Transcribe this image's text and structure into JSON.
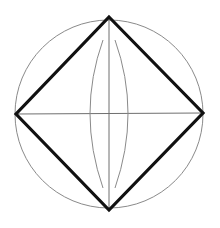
{
  "diagram": {
    "type": "geometric-construction",
    "canvas": {
      "width": 220,
      "height": 228,
      "background": "#ffffff"
    },
    "colors": {
      "thin": "#8a8a8a",
      "thick": "#111111",
      "axis": "#6f6f6f"
    },
    "circle": {
      "cx": 109,
      "cy": 114,
      "r": 94
    },
    "square_vertices": [
      {
        "name": "top",
        "x": 109,
        "y": 17
      },
      {
        "name": "right",
        "x": 203,
        "y": 113
      },
      {
        "name": "bottom",
        "x": 109,
        "y": 210
      },
      {
        "name": "left",
        "x": 16,
        "y": 114
      }
    ],
    "axes": {
      "horizontal": {
        "x1": 16,
        "y1": 114,
        "x2": 203,
        "y2": 113
      },
      "vertical": {
        "x1": 109,
        "y1": 17,
        "x2": 109,
        "y2": 210
      }
    },
    "construction_arcs": [
      {
        "name": "left-arc",
        "path": "M 103 40 Q 77 113 103 188"
      },
      {
        "name": "right-arc",
        "path": "M 115 40 Q 141 113 115 188"
      }
    ]
  }
}
